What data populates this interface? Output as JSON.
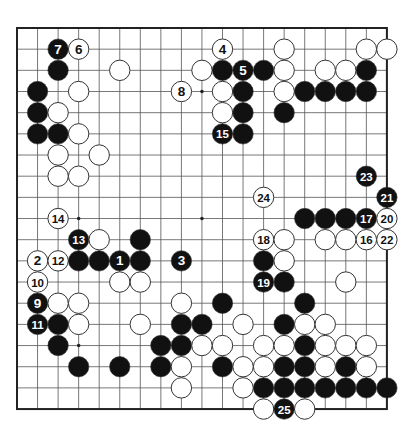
{
  "diagram": {
    "type": "go-board",
    "board_size": 19,
    "geometry": {
      "left": 17,
      "top": 28,
      "col_spacing": 20.55,
      "row_spacing": 21.17,
      "stone_radius": 10.2
    },
    "colors": {
      "background": "#ffffff",
      "grid": "#555555",
      "border": "#222222",
      "black_stone": "#111111",
      "white_stone": "#ffffff",
      "stone_outline": "#333333"
    },
    "hoshi": [
      [
        3,
        3
      ],
      [
        9,
        3
      ],
      [
        15,
        3
      ],
      [
        3,
        9
      ],
      [
        9,
        9
      ],
      [
        15,
        9
      ],
      [
        3,
        15
      ],
      [
        9,
        15
      ],
      [
        15,
        15
      ]
    ],
    "stones": [
      {
        "c": 2,
        "r": 1,
        "color": "black",
        "label": "7"
      },
      {
        "c": 3,
        "r": 1,
        "color": "white",
        "label": "6"
      },
      {
        "c": 10,
        "r": 1,
        "color": "white",
        "label": "4"
      },
      {
        "c": 13,
        "r": 1,
        "color": "white",
        "label": ""
      },
      {
        "c": 17,
        "r": 1,
        "color": "white",
        "label": ""
      },
      {
        "c": 18,
        "r": 1,
        "color": "white",
        "label": ""
      },
      {
        "c": 2,
        "r": 2,
        "color": "black",
        "label": ""
      },
      {
        "c": 5,
        "r": 2,
        "color": "white",
        "label": ""
      },
      {
        "c": 9,
        "r": 2,
        "color": "white",
        "label": ""
      },
      {
        "c": 10,
        "r": 2,
        "color": "black",
        "label": ""
      },
      {
        "c": 11,
        "r": 2,
        "color": "black",
        "label": "5"
      },
      {
        "c": 12,
        "r": 2,
        "color": "black",
        "label": ""
      },
      {
        "c": 13,
        "r": 2,
        "color": "white",
        "label": ""
      },
      {
        "c": 15,
        "r": 2,
        "color": "white",
        "label": ""
      },
      {
        "c": 16,
        "r": 2,
        "color": "white",
        "label": ""
      },
      {
        "c": 17,
        "r": 2,
        "color": "black",
        "label": ""
      },
      {
        "c": 1,
        "r": 3,
        "color": "black",
        "label": ""
      },
      {
        "c": 3,
        "r": 3,
        "color": "white",
        "label": ""
      },
      {
        "c": 8,
        "r": 3,
        "color": "white",
        "label": "8"
      },
      {
        "c": 10,
        "r": 3,
        "color": "white",
        "label": ""
      },
      {
        "c": 11,
        "r": 3,
        "color": "black",
        "label": ""
      },
      {
        "c": 13,
        "r": 3,
        "color": "white",
        "label": ""
      },
      {
        "c": 14,
        "r": 3,
        "color": "black",
        "label": ""
      },
      {
        "c": 15,
        "r": 3,
        "color": "black",
        "label": ""
      },
      {
        "c": 16,
        "r": 3,
        "color": "black",
        "label": ""
      },
      {
        "c": 17,
        "r": 3,
        "color": "black",
        "label": ""
      },
      {
        "c": 1,
        "r": 4,
        "color": "black",
        "label": ""
      },
      {
        "c": 2,
        "r": 4,
        "color": "white",
        "label": ""
      },
      {
        "c": 10,
        "r": 4,
        "color": "white",
        "label": ""
      },
      {
        "c": 11,
        "r": 4,
        "color": "black",
        "label": ""
      },
      {
        "c": 13,
        "r": 4,
        "color": "black",
        "label": ""
      },
      {
        "c": 1,
        "r": 5,
        "color": "black",
        "label": ""
      },
      {
        "c": 2,
        "r": 5,
        "color": "black",
        "label": ""
      },
      {
        "c": 3,
        "r": 5,
        "color": "white",
        "label": ""
      },
      {
        "c": 10,
        "r": 5,
        "color": "black",
        "label": "15"
      },
      {
        "c": 11,
        "r": 5,
        "color": "black",
        "label": ""
      },
      {
        "c": 2,
        "r": 6,
        "color": "white",
        "label": ""
      },
      {
        "c": 4,
        "r": 6,
        "color": "white",
        "label": ""
      },
      {
        "c": 2,
        "r": 7,
        "color": "white",
        "label": ""
      },
      {
        "c": 3,
        "r": 7,
        "color": "white",
        "label": ""
      },
      {
        "c": 17,
        "r": 7,
        "color": "black",
        "label": "23"
      },
      {
        "c": 12,
        "r": 8,
        "color": "white",
        "label": "24"
      },
      {
        "c": 18,
        "r": 8,
        "color": "black",
        "label": "21"
      },
      {
        "c": 2,
        "r": 9,
        "color": "white",
        "label": "14"
      },
      {
        "c": 14,
        "r": 9,
        "color": "black",
        "label": ""
      },
      {
        "c": 15,
        "r": 9,
        "color": "black",
        "label": ""
      },
      {
        "c": 16,
        "r": 9,
        "color": "black",
        "label": ""
      },
      {
        "c": 17,
        "r": 9,
        "color": "black",
        "label": "17"
      },
      {
        "c": 18,
        "r": 9,
        "color": "white",
        "label": "20"
      },
      {
        "c": 3,
        "r": 10,
        "color": "black",
        "label": "13"
      },
      {
        "c": 4,
        "r": 10,
        "color": "white",
        "label": ""
      },
      {
        "c": 6,
        "r": 10,
        "color": "black",
        "label": ""
      },
      {
        "c": 12,
        "r": 10,
        "color": "white",
        "label": "18"
      },
      {
        "c": 13,
        "r": 10,
        "color": "white",
        "label": ""
      },
      {
        "c": 15,
        "r": 10,
        "color": "white",
        "label": ""
      },
      {
        "c": 16,
        "r": 10,
        "color": "white",
        "label": ""
      },
      {
        "c": 17,
        "r": 10,
        "color": "white",
        "label": "16"
      },
      {
        "c": 18,
        "r": 10,
        "color": "white",
        "label": "22"
      },
      {
        "c": 1,
        "r": 11,
        "color": "white",
        "label": "2"
      },
      {
        "c": 2,
        "r": 11,
        "color": "white",
        "label": "12"
      },
      {
        "c": 3,
        "r": 11,
        "color": "black",
        "label": ""
      },
      {
        "c": 4,
        "r": 11,
        "color": "black",
        "label": ""
      },
      {
        "c": 5,
        "r": 11,
        "color": "black",
        "label": "1"
      },
      {
        "c": 6,
        "r": 11,
        "color": "black",
        "label": ""
      },
      {
        "c": 8,
        "r": 11,
        "color": "black",
        "label": "3"
      },
      {
        "c": 12,
        "r": 11,
        "color": "black",
        "label": ""
      },
      {
        "c": 13,
        "r": 11,
        "color": "white",
        "label": ""
      },
      {
        "c": 1,
        "r": 12,
        "color": "white",
        "label": "10"
      },
      {
        "c": 5,
        "r": 12,
        "color": "white",
        "label": ""
      },
      {
        "c": 6,
        "r": 12,
        "color": "white",
        "label": ""
      },
      {
        "c": 12,
        "r": 12,
        "color": "black",
        "label": "19"
      },
      {
        "c": 13,
        "r": 12,
        "color": "black",
        "label": ""
      },
      {
        "c": 16,
        "r": 12,
        "color": "white",
        "label": ""
      },
      {
        "c": 1,
        "r": 13,
        "color": "black",
        "label": "9"
      },
      {
        "c": 2,
        "r": 13,
        "color": "white",
        "label": ""
      },
      {
        "c": 3,
        "r": 13,
        "color": "white",
        "label": ""
      },
      {
        "c": 8,
        "r": 13,
        "color": "white",
        "label": ""
      },
      {
        "c": 10,
        "r": 13,
        "color": "black",
        "label": ""
      },
      {
        "c": 14,
        "r": 13,
        "color": "black",
        "label": ""
      },
      {
        "c": 1,
        "r": 14,
        "color": "black",
        "label": "11"
      },
      {
        "c": 2,
        "r": 14,
        "color": "black",
        "label": ""
      },
      {
        "c": 3,
        "r": 14,
        "color": "white",
        "label": ""
      },
      {
        "c": 6,
        "r": 14,
        "color": "white",
        "label": ""
      },
      {
        "c": 8,
        "r": 14,
        "color": "black",
        "label": ""
      },
      {
        "c": 9,
        "r": 14,
        "color": "black",
        "label": ""
      },
      {
        "c": 11,
        "r": 14,
        "color": "white",
        "label": ""
      },
      {
        "c": 13,
        "r": 14,
        "color": "black",
        "label": ""
      },
      {
        "c": 14,
        "r": 14,
        "color": "white",
        "label": ""
      },
      {
        "c": 15,
        "r": 14,
        "color": "white",
        "label": ""
      },
      {
        "c": 2,
        "r": 15,
        "color": "black",
        "label": ""
      },
      {
        "c": 7,
        "r": 15,
        "color": "black",
        "label": ""
      },
      {
        "c": 8,
        "r": 15,
        "color": "black",
        "label": ""
      },
      {
        "c": 9,
        "r": 15,
        "color": "white",
        "label": ""
      },
      {
        "c": 10,
        "r": 15,
        "color": "white",
        "label": ""
      },
      {
        "c": 12,
        "r": 15,
        "color": "white",
        "label": ""
      },
      {
        "c": 13,
        "r": 15,
        "color": "white",
        "label": ""
      },
      {
        "c": 14,
        "r": 15,
        "color": "black",
        "label": ""
      },
      {
        "c": 15,
        "r": 15,
        "color": "white",
        "label": ""
      },
      {
        "c": 16,
        "r": 15,
        "color": "white",
        "label": ""
      },
      {
        "c": 17,
        "r": 15,
        "color": "white",
        "label": ""
      },
      {
        "c": 3,
        "r": 16,
        "color": "black",
        "label": ""
      },
      {
        "c": 5,
        "r": 16,
        "color": "black",
        "label": ""
      },
      {
        "c": 7,
        "r": 16,
        "color": "black",
        "label": ""
      },
      {
        "c": 8,
        "r": 16,
        "color": "white",
        "label": ""
      },
      {
        "c": 10,
        "r": 16,
        "color": "black",
        "label": ""
      },
      {
        "c": 11,
        "r": 16,
        "color": "white",
        "label": ""
      },
      {
        "c": 12,
        "r": 16,
        "color": "white",
        "label": ""
      },
      {
        "c": 13,
        "r": 16,
        "color": "black",
        "label": ""
      },
      {
        "c": 14,
        "r": 16,
        "color": "black",
        "label": ""
      },
      {
        "c": 15,
        "r": 16,
        "color": "white",
        "label": ""
      },
      {
        "c": 16,
        "r": 16,
        "color": "black",
        "label": ""
      },
      {
        "c": 17,
        "r": 16,
        "color": "white",
        "label": ""
      },
      {
        "c": 8,
        "r": 17,
        "color": "white",
        "label": ""
      },
      {
        "c": 11,
        "r": 17,
        "color": "white",
        "label": ""
      },
      {
        "c": 12,
        "r": 17,
        "color": "black",
        "label": ""
      },
      {
        "c": 13,
        "r": 17,
        "color": "black",
        "label": ""
      },
      {
        "c": 14,
        "r": 17,
        "color": "black",
        "label": ""
      },
      {
        "c": 15,
        "r": 17,
        "color": "black",
        "label": ""
      },
      {
        "c": 16,
        "r": 17,
        "color": "black",
        "label": ""
      },
      {
        "c": 17,
        "r": 17,
        "color": "black",
        "label": ""
      },
      {
        "c": 18,
        "r": 17,
        "color": "black",
        "label": ""
      },
      {
        "c": 12,
        "r": 18,
        "color": "white",
        "label": ""
      },
      {
        "c": 13,
        "r": 18,
        "color": "black",
        "label": "25"
      },
      {
        "c": 14,
        "r": 18,
        "color": "white",
        "label": ""
      }
    ]
  }
}
